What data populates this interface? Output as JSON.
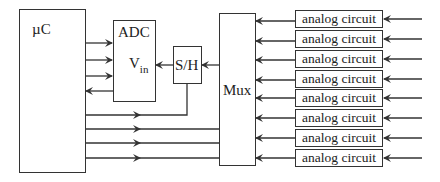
{
  "diagram": {
    "microcontroller": {
      "label": "µC"
    },
    "adc": {
      "label": "ADC",
      "input_label": "V",
      "input_subscript": "in"
    },
    "sample_hold": {
      "label": "S/H"
    },
    "mux": {
      "label": "Mux"
    },
    "analog_circuits": [
      {
        "label": "analog circuit"
      },
      {
        "label": "analog circuit"
      },
      {
        "label": "analog circuit"
      },
      {
        "label": "analog circuit"
      },
      {
        "label": "analog circuit"
      },
      {
        "label": "analog circuit"
      },
      {
        "label": "analog circuit"
      },
      {
        "label": "analog circuit"
      }
    ],
    "colors": {
      "line": "#333333",
      "background": "#ffffff"
    }
  }
}
